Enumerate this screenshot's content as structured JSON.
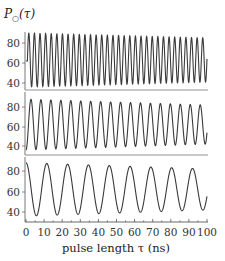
{
  "chart_data": {
    "type": "line",
    "note": "Approximation only: curves are parametric sine models fitted by eye (period from peak counts, envelope/phase estimated), not digitized sample points.",
    "ylabel": "P_○(τ)",
    "xlabel": "pulse length τ (ns)",
    "xlim": [
      0,
      100
    ],
    "x_ticks": [
      0,
      10,
      20,
      30,
      40,
      50,
      60,
      70,
      80,
      90,
      100
    ],
    "x_tick_labels": [
      "0",
      "10",
      "20",
      "30",
      "40",
      "50",
      "60",
      "70",
      "80",
      "90",
      "100"
    ],
    "grid": false,
    "legend": "none",
    "panels": [
      {
        "name": "top",
        "ylim": [
          35,
          92
        ],
        "y_ticks": [
          40,
          60,
          80
        ],
        "y_tick_labels": [
          "40",
          "60",
          "80"
        ],
        "series": {
          "name": "Rabi oscillation (fast)",
          "approx_period_ns": 3.1,
          "approx_peaks": 32,
          "approx_min": 36,
          "approx_max": 90,
          "model": "62.5 + A(τ)·sin(2π τ / 3.1 + φ)",
          "amplitude_start": 27,
          "amplitude_end": 22
        }
      },
      {
        "name": "middle",
        "ylim": [
          35,
          92
        ],
        "y_ticks": [
          40,
          60,
          80
        ],
        "y_tick_labels": [
          "40",
          "60",
          "80"
        ],
        "series": {
          "name": "Rabi oscillation (medium)",
          "approx_period_ns": 5.5,
          "approx_peaks": 18,
          "approx_min": 36,
          "approx_max": 88,
          "model": "62 + A(τ)·sin(2π τ / 5.5 + φ)",
          "amplitude_start": 26,
          "amplitude_end": 20
        }
      },
      {
        "name": "bottom",
        "ylim": [
          33,
          92
        ],
        "y_ticks": [
          40,
          60,
          80
        ],
        "y_tick_labels": [
          "40",
          "60",
          "80"
        ],
        "series": {
          "name": "Rabi oscillation (slow)",
          "approx_period_ns": 11.5,
          "approx_peaks": 9,
          "approx_min": 36,
          "approx_max": 88,
          "model": "62 + A(τ)·cos(2π τ / 11.5 + φ)",
          "amplitude_start": 26,
          "amplitude_end": 20
        }
      }
    ]
  },
  "labels": {
    "ylabel": "P",
    "ylabel_sub": "○",
    "ylabel_arg": "(τ)",
    "xlabel": "pulse length τ (ns)",
    "xt0": "0",
    "xt1": "10",
    "xt2": "20",
    "xt3": "30",
    "xt4": "40",
    "xt5": "50",
    "xt6": "60",
    "xt7": "70",
    "xt8": "80",
    "xt9": "90",
    "xt10": "100",
    "y80": "80",
    "y60": "60",
    "y40": "40"
  }
}
